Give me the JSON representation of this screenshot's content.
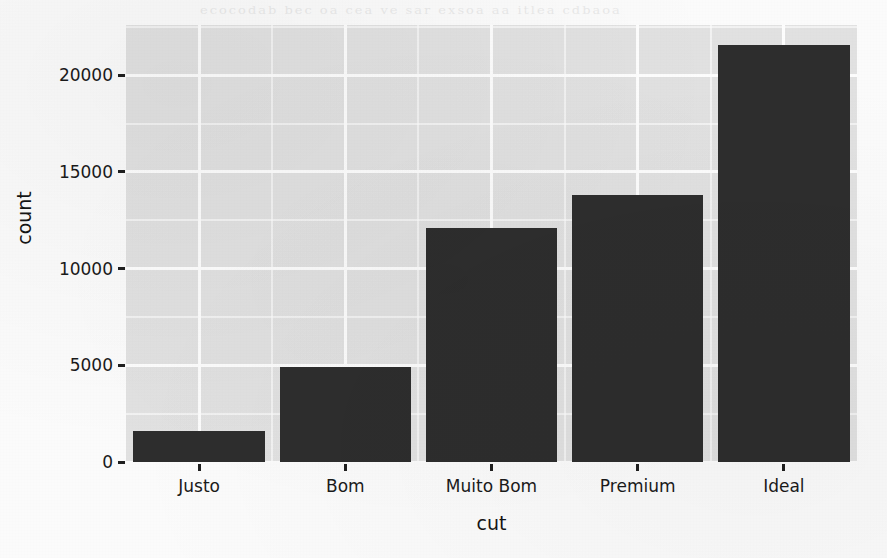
{
  "chart_data": {
    "type": "bar",
    "title": "",
    "subtitle": "",
    "xlabel": "cut",
    "ylabel": "count",
    "categories": [
      "Justo",
      "Bom",
      "Muito Bom",
      "Premium",
      "Ideal"
    ],
    "values": [
      1610,
      4906,
      12082,
      13791,
      21551
    ],
    "series": [
      {
        "name": "count",
        "values": [
          1610,
          4906,
          12082,
          13791,
          21551
        ]
      }
    ],
    "ylim": [
      0,
      22600
    ],
    "xlim": [
      0,
      5
    ],
    "y_ticks": [
      0,
      5000,
      10000,
      15000,
      20000
    ],
    "y_tick_labels": [
      "0",
      "5000",
      "10000",
      "15000",
      "20000"
    ],
    "y_minor_ticks": [
      2500,
      7500,
      12500,
      17500,
      22500
    ],
    "grid": true,
    "grid_color": "#ffffff",
    "panel_background": "#e3e3e3",
    "bar_color": "#2d2d2d",
    "legend": null,
    "legend_position": "none",
    "annotations": []
  },
  "figure": {
    "axis_text_color": "#1a1a1a",
    "page_background": "#fdfdfd"
  },
  "page": {
    "ghost_text": "ecocodab  bec oa  cea ve  sar exsoa aa itlea  cdbaoa"
  }
}
